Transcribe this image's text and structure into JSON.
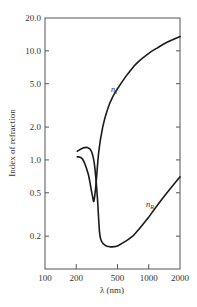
{
  "chart_data": {
    "type": "line",
    "title": "",
    "xlabel": "λ (nm)",
    "ylabel": "Index of refraction",
    "xscale": "log",
    "yscale": "log",
    "xlim": [
      100,
      2000
    ],
    "ylim": [
      0.1,
      20.0
    ],
    "grid": false,
    "legend_position": "inline labels on curves",
    "x_ticks": [
      100,
      200,
      500,
      1000,
      2000
    ],
    "x_tick_labels": [
      "100",
      "200",
      "500",
      "1000",
      "2000"
    ],
    "y_ticks": [
      0.2,
      0.5,
      1.0,
      2.0,
      5.0,
      10.0,
      20.0
    ],
    "y_tick_labels": [
      "0.2",
      "0.5",
      "1.0",
      "2.0",
      "5.0",
      "10.0",
      "20.0"
    ],
    "series": [
      {
        "name": "n_I",
        "label": "n",
        "subscript": "I",
        "x": [
          205,
          230,
          260,
          285,
          296,
          310,
          330,
          360,
          400,
          450,
          500,
          600,
          700,
          800,
          1000,
          1200,
          1500,
          2000
        ],
        "y": [
          1.07,
          1.02,
          0.75,
          0.48,
          0.42,
          0.6,
          1.2,
          2.0,
          2.9,
          3.8,
          4.5,
          5.8,
          7.0,
          8.0,
          9.5,
          10.6,
          12.0,
          13.5
        ]
      },
      {
        "name": "n_R",
        "label": "n",
        "subscript": "R",
        "x": [
          205,
          230,
          255,
          280,
          300,
          320,
          335,
          350,
          380,
          420,
          457,
          500,
          600,
          700,
          800,
          1000,
          1200,
          1500,
          2000
        ],
        "y": [
          1.2,
          1.28,
          1.3,
          1.2,
          0.9,
          0.45,
          0.22,
          0.18,
          0.165,
          0.16,
          0.16,
          0.163,
          0.18,
          0.2,
          0.23,
          0.3,
          0.38,
          0.5,
          0.7
        ]
      }
    ],
    "annotations": [
      {
        "text": "n_I",
        "near": {
          "x": 520,
          "y": 5.8
        }
      },
      {
        "text": "n_R",
        "near": {
          "x": 960,
          "y": 0.3
        }
      }
    ]
  },
  "labels": {
    "ylabel": "Index of refraction",
    "xlabel": "λ (nm)",
    "series_base": "n",
    "series_nI_sub": "I",
    "series_nR_sub": "R"
  }
}
